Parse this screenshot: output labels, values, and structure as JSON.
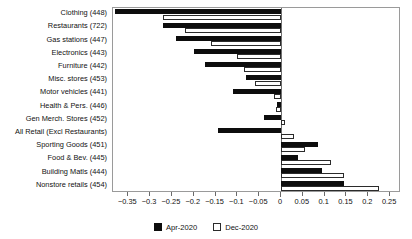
{
  "chart_data": {
    "type": "bar",
    "orientation": "horizontal",
    "title": "",
    "xlabel": "",
    "ylabel": "",
    "grid": false,
    "xlim": [
      -0.385,
      0.275
    ],
    "xticks": [
      -0.35,
      -0.3,
      -0.25,
      -0.2,
      -0.15,
      -0.1,
      -0.05,
      0,
      0.05,
      0.1,
      0.15,
      0.2,
      0.25
    ],
    "xtick_labels": [
      "−0.35",
      "−0.3",
      "−0.25",
      "−0.2",
      "−0.15",
      "−0.1",
      "−0.05",
      "0",
      "0.05",
      "0.1",
      "0.15",
      "0.2",
      "0.25"
    ],
    "categories": [
      "Clothing (448)",
      "Restaurants (722)",
      "Gas stations (447)",
      "Electronics (443)",
      "Furniture (442)",
      "Misc. stores (453)",
      "Motor vehicles (441)",
      "Health & Pers. (446)",
      "Gen Merch. Stores (452)",
      "All Retail (Excl Restaurants)",
      "Sporting Goods (451)",
      "Food & Bev. (445)",
      "Building Matls (444)",
      "Nonstore retails (454)"
    ],
    "legend_position": "bottom-center",
    "series": [
      {
        "name": "Apr-2020",
        "color": "#0d0d0d",
        "fill": "solid",
        "values": [
          -0.38,
          -0.27,
          -0.24,
          -0.2,
          -0.175,
          -0.08,
          -0.11,
          -0.01,
          -0.04,
          -0.145,
          0.085,
          0.04,
          0.095,
          0.145
        ]
      },
      {
        "name": "Dec-2020",
        "color": "#ffffff",
        "fill": "open",
        "values": [
          -0.27,
          -0.22,
          -0.16,
          -0.1,
          -0.085,
          -0.06,
          -0.015,
          -0.012,
          0.01,
          0.03,
          0.055,
          0.115,
          0.145,
          0.225
        ]
      }
    ]
  },
  "legend": {
    "items": [
      {
        "label": "Apr-2020",
        "style": "apr"
      },
      {
        "label": "Dec-2020",
        "style": "dec"
      }
    ]
  }
}
